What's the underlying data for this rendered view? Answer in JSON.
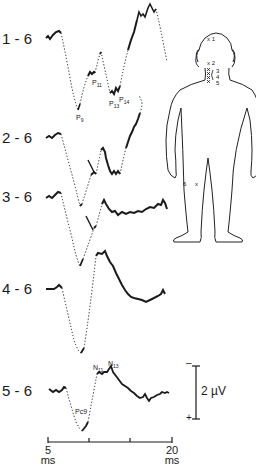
{
  "figure": {
    "traces": [
      {
        "label": "1 - 6",
        "peaks": [
          "P9",
          "P11",
          "P13",
          "P14"
        ]
      },
      {
        "label": "2 - 6",
        "peaks": []
      },
      {
        "label": "3 - 6",
        "peaks": []
      },
      {
        "label": "4 - 6",
        "peaks": []
      },
      {
        "label": "5 - 6",
        "peaks": [
          "Pc9",
          "N11",
          "N13"
        ]
      }
    ],
    "peak_labels": {
      "p9": {
        "main": "P",
        "sub": "9"
      },
      "p11": {
        "main": "P",
        "sub": "11"
      },
      "p13": {
        "main": "P",
        "sub": "13"
      },
      "p14": {
        "main": "P",
        "sub": "14"
      },
      "pc9": "Pc9",
      "n11": {
        "main": "N",
        "sub": "11"
      },
      "n13": {
        "main": "N",
        "sub": "13"
      }
    },
    "electrodes": {
      "e1": "x 1",
      "e2": "x 2",
      "e3": "3",
      "e4": "4",
      "e5": "5",
      "e6": "6",
      "e6x": "x"
    },
    "time_axis": {
      "start": "5",
      "start_unit": "ms",
      "end": "20",
      "end_unit": "ms",
      "ticks": 4
    },
    "calibration": {
      "value": "2 µV",
      "neg": "–",
      "pos": "+"
    }
  }
}
